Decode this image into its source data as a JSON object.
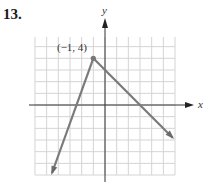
{
  "problem": {
    "number": "13."
  },
  "chart_data": {
    "type": "line",
    "title": "",
    "xlabel": "x",
    "ylabel": "y",
    "xlim": [
      -6,
      6
    ],
    "ylim": [
      -6,
      6
    ],
    "grid": true,
    "grid_step": 1,
    "vertex": {
      "x": -1,
      "y": 4,
      "label": "(−1, 4)"
    },
    "series": [
      {
        "name": "left-ray",
        "points": [
          [
            -1,
            4
          ],
          [
            -4.6,
            -6.8
          ]
        ],
        "slope": 3,
        "direction": "down-left"
      },
      {
        "name": "right-ray",
        "points": [
          [
            -1,
            4
          ],
          [
            5.8,
            -2.8
          ]
        ],
        "slope": -1,
        "direction": "down-right"
      }
    ],
    "x_intercepts": [
      -2.33,
      3
    ],
    "colors": {
      "line": "#7a7a7a",
      "grid": "#d4d4d4",
      "axis": "#333333"
    }
  }
}
